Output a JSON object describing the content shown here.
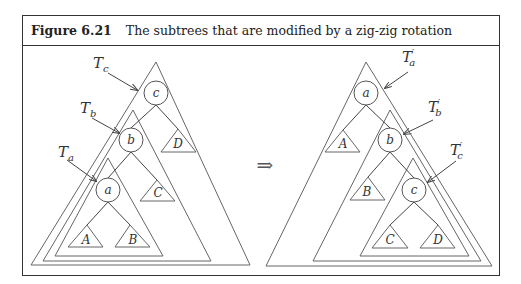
{
  "figure": {
    "number": "Figure 6.21",
    "caption": "The subtrees that are modified by a zig-zig rotation"
  },
  "left_tree": {
    "nodes": {
      "c": "c",
      "b": "b",
      "a": "a"
    },
    "subtrees": {
      "A": "A",
      "B": "B",
      "C": "C",
      "D": "D"
    },
    "labels": {
      "Tc": {
        "main": "T",
        "sub": "c"
      },
      "Tb": {
        "main": "T",
        "sub": "b"
      },
      "Ta": {
        "main": "T",
        "sub": "a"
      }
    }
  },
  "transform_arrow": "⇒",
  "right_tree": {
    "nodes": {
      "a": "a",
      "b": "b",
      "c": "c"
    },
    "subtrees": {
      "A": "A",
      "B": "B",
      "C": "C",
      "D": "D"
    },
    "labels": {
      "Ta": {
        "main": "T",
        "prime": "′",
        "sub": "a"
      },
      "Tb": {
        "main": "T",
        "prime": "′",
        "sub": "b"
      },
      "Tc": {
        "main": "T",
        "prime": "′",
        "sub": "c"
      }
    }
  },
  "colors": {
    "border": "#333333",
    "line": "#666666",
    "background": "#ffffff"
  }
}
